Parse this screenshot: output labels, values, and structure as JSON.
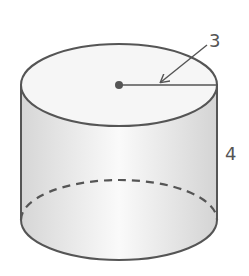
{
  "diagram": {
    "shape": "cylinder",
    "labels": {
      "radius": "3",
      "height": "4"
    },
    "colors": {
      "stroke": "#555555",
      "fill_light": "#f7f7f7",
      "fill_shade": "#d8d8d8",
      "label": "#555555"
    }
  }
}
